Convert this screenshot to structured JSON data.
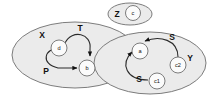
{
  "diagram": {
    "type": "set-graph-diagram",
    "background_color": "#ffffff",
    "set_fill_color": "#ebebeb",
    "set_stroke_color": "#6e6e6e",
    "node_fill_color": "#fbfbfb",
    "edge_color": "#2b2b2b",
    "sets": [
      {
        "id": "X",
        "label": "X"
      },
      {
        "id": "Y",
        "label": "Y"
      },
      {
        "id": "Z",
        "label": "Z"
      }
    ],
    "nodes": [
      {
        "id": "d",
        "label": "d",
        "set": "X"
      },
      {
        "id": "b",
        "label": "b",
        "set": "X"
      },
      {
        "id": "a",
        "label": "a",
        "set": "Y"
      },
      {
        "id": "c2",
        "label": "c2",
        "set": "Y"
      },
      {
        "id": "c1",
        "label": "c1",
        "set": "Y"
      },
      {
        "id": "c",
        "label": "c",
        "set": "Z"
      }
    ],
    "edges": [
      {
        "id": "edge-d-b-top",
        "from": "d",
        "to": "b",
        "label": "T"
      },
      {
        "id": "edge-d-b-bottom",
        "from": "d",
        "to": "b",
        "label": "P"
      },
      {
        "id": "edge-c2-a",
        "from": "c2",
        "to": "a",
        "label": "S"
      },
      {
        "id": "edge-c1-a",
        "from": "c1",
        "to": "a",
        "label": "S"
      }
    ],
    "edge_labels": {
      "T": "T",
      "P": "P",
      "S_upper": "S",
      "S_lower": "S"
    }
  }
}
